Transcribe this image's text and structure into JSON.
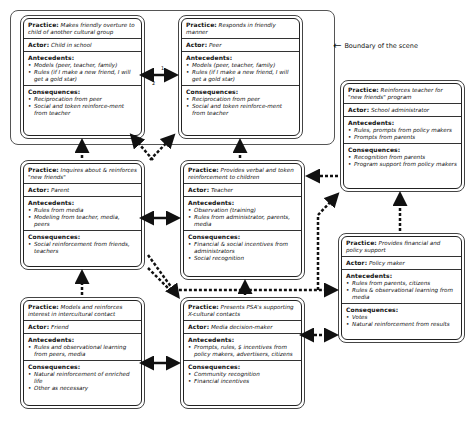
{
  "legend": {
    "label": "Boundary of the scene",
    "icon": "arrow-left-icon"
  },
  "labels": {
    "practice": "Practice:",
    "actor": "Actor:",
    "antecedents": "Antecedents:",
    "consequences": "Consequences:"
  },
  "boxes": [
    {
      "practice": "Makes friendly overture to child of another cultural group",
      "actor": "Child in school",
      "antecedents": [
        "Models (peer, teacher, family)",
        "Rules (if I make a new friend, I will get a gold star)"
      ],
      "consequences": [
        "Reciprocation from peer",
        "Social and token reinforce-ment from teacher"
      ]
    },
    {
      "practice": "Responds in friendly manner",
      "actor": "Peer",
      "antecedents": [
        "Models (peer, teacher, family)",
        "Rules (if I make a new friend, I will get a gold star)"
      ],
      "consequences": [
        "Reciprocation from peer",
        "Social and token reinforce-ment from teacher"
      ]
    },
    {
      "practice": "Reinforces teacher for \"new friends\" program",
      "actor": "School administrator",
      "antecedents": [
        "Rules, prompts from policy makers",
        "Prompts from parents"
      ],
      "consequences": [
        "Recognition from parents",
        "Program support from policy makers"
      ]
    },
    {
      "practice": "Inquires about & reinforces \"new friends\"",
      "actor": "Parent",
      "antecedents": [
        "Rules from media",
        "Modeling from teacher, media, peers"
      ],
      "consequences": [
        "Social reinforcement from friends, teachers"
      ]
    },
    {
      "practice": "Provides verbal and token reinforcement to children",
      "actor": "Teacher",
      "antecedents": [
        "Observation (training)",
        "Rules from administrator, parents, media"
      ],
      "consequences": [
        "Financial & social incentives from administrators",
        "Social recognition"
      ]
    },
    {
      "practice": "Provides financial and policy support",
      "actor": "Policy maker",
      "antecedents": [
        "Rules from parents, citizens",
        "Rules & observational learning from media"
      ],
      "consequences": [
        "Votes",
        "Natural reinforcement from results"
      ]
    },
    {
      "practice": "Models and reinforces interest in intercultural contact",
      "actor": "Friend",
      "antecedents": [
        "Rules and observational learning from peers, media"
      ],
      "consequences": [
        "Natural reinforcement of enriched life",
        "Other as necessary"
      ]
    },
    {
      "practice": "Presents PSA's supporting X-cultural contacts",
      "actor": "Media decision-maker",
      "antecedents": [
        "Prompts, rules, $ incentives from policy makers, advertisers, citizens"
      ],
      "consequences": [
        "Community recognition",
        "Financial incentives"
      ]
    }
  ],
  "arrow_labels": {
    "top": "1",
    "bottom": "2"
  }
}
